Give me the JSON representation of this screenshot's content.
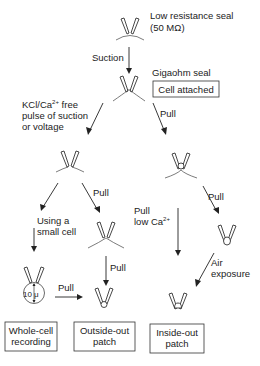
{
  "diagram": {
    "nodes": {
      "low_resistance": {
        "label_line1": "Low resistance seal",
        "label_line2": "(50 MΩ)"
      },
      "gigaohm": {
        "label": "Gigaohm seal",
        "box": "Cell attached"
      },
      "whole_cell": {
        "box_line1": "Whole-cell",
        "box_line2": "recording",
        "cell_size": "10 μ"
      },
      "outside_out": {
        "box_line1": "Outside-out",
        "box_line2": "patch"
      },
      "inside_out": {
        "box_line1": "Inside-out",
        "box_line2": "patch"
      }
    },
    "edges": {
      "suction": "Suction",
      "kcl_line1": "KCl/Ca",
      "kcl_sup": "2+",
      "kcl_line1_tail": " free",
      "kcl_line2": "pulse of suction",
      "kcl_line3": "or voltage",
      "pull_right": "Pull",
      "small_cell_line1": "Using a",
      "small_cell_line2": "small cell",
      "pull_mid": "Pull",
      "pull_outside": "Pull",
      "pull_whole": "Pull",
      "pull_low_ca_line1": "Pull",
      "pull_low_ca_line2": "low Ca",
      "pull_low_ca_sup": "2+",
      "pull_vesicle": "Pull",
      "air_line1": "Air",
      "air_line2": "exposure"
    }
  }
}
